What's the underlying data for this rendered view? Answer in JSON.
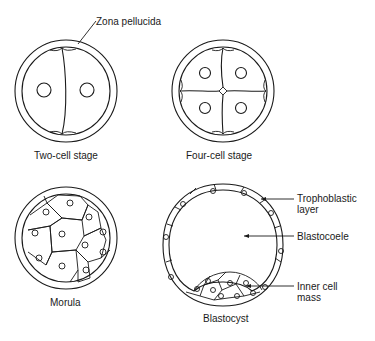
{
  "figure": {
    "panels": [
      {
        "id": "two-cell",
        "caption": "Two-cell stage",
        "cells": 2
      },
      {
        "id": "four-cell",
        "caption": "Four-cell stage",
        "cells": 4
      },
      {
        "id": "morula",
        "caption": "Morula",
        "cells": 12
      },
      {
        "id": "blastocyst",
        "caption": "Blastocyst"
      }
    ],
    "annotations": {
      "zona_pellucida": "Zona pellucida",
      "trophoblastic_line1": "Trophoblastic",
      "trophoblastic_line2": "layer",
      "blastocoele": "Blastocoele",
      "inner_cell_line1": "Inner cell",
      "inner_cell_line2": "mass"
    },
    "colors": {
      "line": "#1a1a1a",
      "background": "#ffffff"
    }
  }
}
